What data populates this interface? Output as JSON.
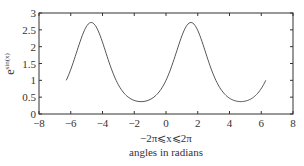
{
  "chart_data": {
    "type": "line",
    "title": "",
    "function": "exp(sin(x))",
    "x_domain": [
      -6.2832,
      6.2832
    ],
    "xlabel_line1": "−2π⩽x⩽2π",
    "xlabel_line2": "angles in radians",
    "ylabel_base": "e",
    "ylabel_sup": "sin(x)",
    "xlim": [
      -8,
      8
    ],
    "ylim": [
      0,
      3
    ],
    "xticks": [
      -8,
      -6,
      -4,
      -2,
      0,
      2,
      4,
      6,
      8
    ],
    "xtick_labels": [
      "−8",
      "−6",
      "−4",
      "−2",
      "0",
      "2",
      "4",
      "6",
      "8"
    ],
    "yticks": [
      0,
      0.5,
      1,
      1.5,
      2,
      2.5,
      3
    ],
    "ytick_labels": [
      "0",
      "0.5",
      "1",
      "1.5",
      "2",
      "2.5",
      "3"
    ],
    "grid": false,
    "legend": null,
    "series": [
      {
        "name": "e^sin(x)",
        "x": [
          -6.2832,
          -5.4978,
          -4.7124,
          -3.927,
          -3.1416,
          -2.3562,
          -1.5708,
          -0.7854,
          0,
          0.7854,
          1.5708,
          2.3562,
          3.1416,
          3.927,
          4.7124,
          5.4978,
          6.2832
        ],
        "y": [
          1.0,
          2.028,
          2.718,
          2.028,
          1.0,
          0.493,
          0.368,
          0.493,
          1.0,
          2.028,
          2.718,
          2.028,
          1.0,
          0.493,
          0.368,
          0.493,
          1.0
        ]
      }
    ],
    "colors": {
      "line": "#555555",
      "axes": "#333333",
      "text": "#333333"
    }
  }
}
